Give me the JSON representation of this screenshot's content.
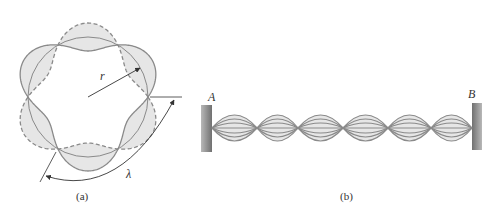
{
  "figure_a": {
    "caption": "(a)",
    "radius_label": "r",
    "wavelength_label": "λ",
    "description": "Circular standing wave: solid and dashed wave envelopes alternating around a circle of radius r",
    "node_count": 6,
    "lobe_count": 6
  },
  "figure_b": {
    "caption": "(b)",
    "left_end_label": "A",
    "right_end_label": "B",
    "description": "String fixed between walls A and B vibrating as a standing wave",
    "loop_count": 6,
    "envelopes_per_loop": 3
  },
  "colors": {
    "wave_stroke": "#8a8a8a",
    "lobe_fill": "#e6e6e6",
    "arrow": "#333333",
    "wall_dark": "#6e6e6e",
    "wall_light": "#b5b5b5"
  }
}
